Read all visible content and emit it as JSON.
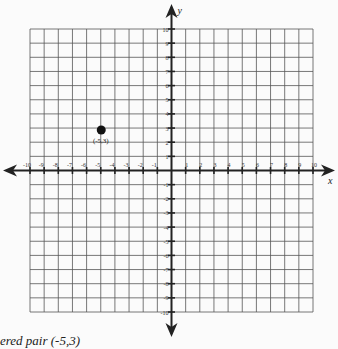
{
  "chart_data": {
    "type": "scatter",
    "title": "",
    "xlabel": "x",
    "ylabel": "y",
    "xlim": [
      -10,
      10
    ],
    "ylim": [
      -10,
      10
    ],
    "grid": true,
    "x_ticks": [
      -10,
      -9,
      -8,
      -7,
      -6,
      -5,
      -4,
      -3,
      -2,
      -1,
      1,
      2,
      3,
      4,
      5,
      6,
      7,
      8,
      9,
      10
    ],
    "y_ticks": [
      -10,
      -9,
      -8,
      -7,
      -6,
      -5,
      -4,
      -3,
      -2,
      -1,
      1,
      2,
      3,
      4,
      5,
      6,
      7,
      8,
      9,
      10
    ],
    "points": [
      {
        "x": -5,
        "y": 3,
        "label": "(-5,3)"
      }
    ]
  },
  "caption": "ered pair (-5,3)"
}
